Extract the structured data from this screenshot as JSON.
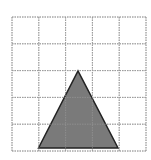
{
  "grid": {
    "columns": 5,
    "rows": 5,
    "origin": [
      12,
      17
    ],
    "cell_size": 26.8,
    "line_color": "#9a9a9a"
  },
  "triangle": {
    "points": [
      [
        38.5,
        148
      ],
      [
        78,
        71
      ],
      [
        118,
        148
      ]
    ],
    "fill": "#7a7a7a",
    "stroke": "#222222"
  }
}
